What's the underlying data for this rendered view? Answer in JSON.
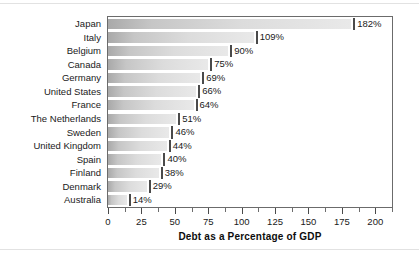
{
  "chart_data": {
    "type": "bar",
    "orientation": "horizontal",
    "title": "",
    "xlabel": "Debt as a Percentage of GDP",
    "ylabel": "",
    "xlim": [
      0,
      212.5
    ],
    "grid": false,
    "legend": null,
    "value_suffix": "%",
    "xticks": [
      0,
      25,
      50,
      75,
      100,
      125,
      150,
      175,
      200
    ],
    "xtick_labels": [
      "0",
      "25",
      "50",
      "75",
      "100",
      "125",
      "150",
      "175",
      "200"
    ],
    "minor_tick_step": 12.5,
    "categories": [
      "Japan",
      "Italy",
      "Belgium",
      "Canada",
      "Germany",
      "United States",
      "France",
      "The Netherlands",
      "Sweden",
      "United Kingdom",
      "Spain",
      "Finland",
      "Denmark",
      "Australia"
    ],
    "values": [
      182,
      109,
      90,
      75,
      69,
      66,
      64,
      51,
      46,
      44,
      40,
      38,
      29,
      14
    ],
    "data_labels": [
      "182%",
      "109%",
      "90%",
      "75%",
      "69%",
      "66%",
      "64%",
      "51%",
      "46%",
      "44%",
      "40%",
      "38%",
      "29%",
      "14%"
    ],
    "colors": {
      "bar_gradient_start": "#a9a9a9",
      "bar_gradient_end": "#e9e9e9",
      "axis": "#6b6b6b",
      "text": "#1a1a1a",
      "background": "#ffffff"
    }
  }
}
